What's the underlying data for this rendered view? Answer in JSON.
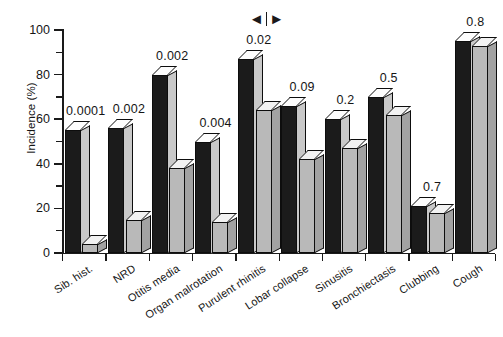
{
  "chart_data": {
    "type": "bar",
    "title": "",
    "subtitle": "",
    "xlabel": "",
    "ylabel": "Incidence (%)",
    "ylim": [
      0,
      100
    ],
    "yticks": [
      0,
      20,
      40,
      60,
      80,
      100
    ],
    "ytick_labels": [
      "0",
      "20",
      "40",
      "60",
      "80",
      "100"
    ],
    "grid": false,
    "legend_position": "none",
    "categories": [
      "Sib. hist.",
      "NRD",
      "Otitis media",
      "Organ malrotation",
      "Purulent rhinitis",
      "Lobar collapse",
      "Sinusitis",
      "Bronchiectasis",
      "Clubbing",
      "Cough"
    ],
    "series": [
      {
        "name": "series-1-dark",
        "values": [
          55,
          56,
          80,
          50,
          87,
          66,
          60,
          70,
          21,
          95
        ]
      },
      {
        "name": "series-2-light",
        "values": [
          4,
          15,
          38,
          14,
          64,
          42,
          47,
          62,
          18,
          93
        ]
      }
    ],
    "annotations": {
      "p_values": [
        "0.0001",
        "0.002",
        "0.002",
        "0.004",
        "0.02",
        "0.09",
        "0.2",
        "0.5",
        "0.7",
        "0.8"
      ],
      "marker": {
        "name": "significance-range-marker",
        "left_glyph": "◄",
        "right_glyph": "►"
      }
    }
  }
}
